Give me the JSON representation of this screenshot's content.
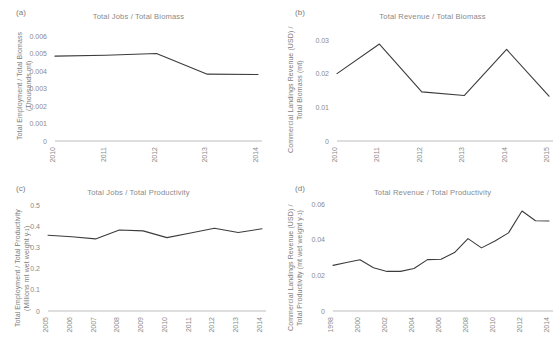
{
  "figure": {
    "background_color": "#ffffff",
    "line_color": "#3c3c3c",
    "axis_color": "#bdbdbd",
    "text_color": "#8a8a8a"
  },
  "panels": [
    {
      "label": "(a)",
      "title": "Total Jobs / Total Biomass",
      "ylabel_line1": "Total Employment / Total Biomass",
      "ylabel_line2": "(Thousands mt)"
    },
    {
      "label": "(b)",
      "title": "Total Revenue / Total Biomass",
      "ylabel_line1": "Commercial Landings Revenue (USD) /",
      "ylabel_line2": "Total Biomass (mt)"
    },
    {
      "label": "(c)",
      "title": "Total Jobs / Total Productivity",
      "ylabel_line1": "Total Employment / Total Productivity",
      "ylabel_line2": "(Millions mt wet weight y",
      "ylabel_line2_sup": "-1",
      "ylabel_line2_end": ")"
    },
    {
      "label": "(d)",
      "title": "Total Revenue / Total Productivity",
      "ylabel_line1": "Commercial Landings Revenue (USD) /",
      "ylabel_line2": "Total Productivity (mt wet weight y",
      "ylabel_line2_sup": "-1",
      "ylabel_line2_end": ")"
    }
  ],
  "chart_data": [
    {
      "type": "line",
      "panel": "(a)",
      "title": "Total Jobs / Total Biomass",
      "xlabel": "",
      "ylabel": "Total Employment / Total Biomass (Thousands mt)",
      "x": [
        2010,
        2011,
        2012,
        2013,
        2014
      ],
      "xtick_labels": [
        "2010",
        "2011",
        "2012",
        "2013",
        "2014"
      ],
      "values": [
        0.00485,
        0.0049,
        0.005,
        0.00382,
        0.0038
      ],
      "ytick_labels": [
        "0",
        "0.001",
        "0.002",
        "0.003",
        "0.004",
        "0.005",
        "0.006"
      ],
      "ytick_values": [
        0,
        0.001,
        0.002,
        0.003,
        0.004,
        0.005,
        0.006
      ],
      "ylim": [
        0,
        0.006
      ],
      "grid": false,
      "legend": "none"
    },
    {
      "type": "line",
      "panel": "(b)",
      "title": "Total Revenue / Total Biomass",
      "xlabel": "",
      "ylabel": "Commercial Landings Revenue (USD) / Total Biomass (mt)",
      "x": [
        2010,
        2011,
        2012,
        2013,
        2014,
        2015
      ],
      "xtick_labels": [
        "2010",
        "2011",
        "2012",
        "2013",
        "2014",
        "2015"
      ],
      "values": [
        0.02,
        0.0288,
        0.0146,
        0.0135,
        0.0272,
        0.0133
      ],
      "ytick_labels": [
        "0",
        "0.01",
        "0.02",
        "0.03"
      ],
      "ytick_values": [
        0,
        0.01,
        0.02,
        0.03
      ],
      "ylim": [
        0,
        0.03
      ],
      "grid": false,
      "legend": "none"
    },
    {
      "type": "line",
      "panel": "(c)",
      "title": "Total Jobs / Total Productivity",
      "xlabel": "",
      "ylabel": "Total Employment / Total Productivity (Millions mt wet weight y-1)",
      "x": [
        2005,
        2006,
        2007,
        2008,
        2009,
        2010,
        2011,
        2012,
        2013,
        2014
      ],
      "xtick_labels": [
        "2005",
        "2006",
        "2007",
        "2008",
        "2009",
        "2010",
        "2011",
        "2012",
        "2013",
        "2014"
      ],
      "values": [
        0.357,
        0.35,
        0.34,
        0.382,
        0.378,
        0.346,
        0.368,
        0.39,
        0.37,
        0.388
      ],
      "ytick_labels": [
        "0",
        "0.1",
        "0.2",
        "0.3",
        "0.4",
        "0.5"
      ],
      "ytick_values": [
        0,
        0.1,
        0.2,
        0.3,
        0.4,
        0.5
      ],
      "ylim": [
        0,
        0.5
      ],
      "grid": false,
      "legend": "none"
    },
    {
      "type": "line",
      "panel": "(d)",
      "title": "Total Revenue / Total Productivity",
      "xlabel": "",
      "ylabel": "Commercial Landings Revenue (USD) / Total Productivity (mt wet weight y-1)",
      "x": [
        1998,
        1999,
        2000,
        2001,
        2002,
        2003,
        2004,
        2005,
        2006,
        2007,
        2008,
        2009,
        2010,
        2011,
        2012,
        2013,
        2014
      ],
      "xtick_labels": [
        "1998",
        "2000",
        "2002",
        "2004",
        "2006",
        "2008",
        "2010",
        "2012",
        "2014"
      ],
      "xtick_x": [
        1998,
        2000,
        2002,
        2004,
        2006,
        2008,
        2010,
        2012,
        2014
      ],
      "values": [
        0.0256,
        0.0272,
        0.0287,
        0.0243,
        0.0222,
        0.0222,
        0.0238,
        0.0288,
        0.029,
        0.0328,
        0.0406,
        0.0354,
        0.0392,
        0.0438,
        0.0561,
        0.0506,
        0.0505
      ],
      "ytick_labels": [
        "0",
        "0.02",
        "0.04",
        "0.06"
      ],
      "ytick_values": [
        0,
        0.02,
        0.04,
        0.06
      ],
      "ylim": [
        0,
        0.06
      ],
      "grid": false,
      "legend": "none"
    }
  ]
}
